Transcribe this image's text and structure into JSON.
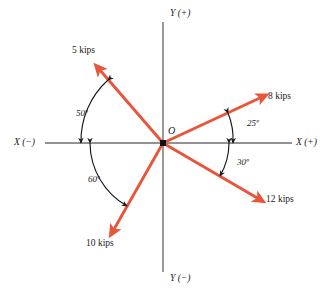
{
  "figure": {
    "type": "free-body-force-diagram",
    "units": "kips",
    "axis_color": "#6e6e6e",
    "vector_color": "#e8553a",
    "arc_color": "#1a1a1a",
    "text_color": "#1a1a1a",
    "background": "#ffffff"
  },
  "origin": {
    "label": "O",
    "x": 163,
    "y": 143
  },
  "axes": [
    {
      "name": "x-negative",
      "label": "X (−)",
      "label_x": 14,
      "label_y": 138
    },
    {
      "name": "x-positive",
      "label": "X (+)",
      "label_x": 296,
      "label_y": 138
    },
    {
      "name": "y-positive",
      "label": "Y (+)",
      "label_x": 170,
      "label_y": 9
    },
    {
      "name": "y-negative",
      "label": "Y (−)",
      "label_x": 170,
      "label_y": 274
    }
  ],
  "forces": [
    {
      "name": "force-5-kips",
      "label": "5 kips",
      "magnitude": 5,
      "angle_deg_from_positive_x": 130,
      "angle_from_axis_deg": 50,
      "reference_axis": "X (−)",
      "quadrant": "II",
      "label_x": 72,
      "label_y": 46
    },
    {
      "name": "force-8-kips",
      "label": "8 kips",
      "magnitude": 8,
      "angle_deg_from_positive_x": 25,
      "angle_from_axis_deg": 25,
      "reference_axis": "X (+)",
      "quadrant": "I",
      "label_x": 268,
      "label_y": 92
    },
    {
      "name": "force-12-kips",
      "label": "12 kips",
      "magnitude": 12,
      "angle_deg_from_positive_x": -30,
      "angle_from_axis_deg": 30,
      "reference_axis": "X (+)",
      "quadrant": "IV",
      "label_x": 266,
      "label_y": 195
    },
    {
      "name": "force-10-kips",
      "label": "10 kips",
      "magnitude": 10,
      "angle_deg_from_positive_x": 240,
      "angle_from_axis_deg": 60,
      "reference_axis": "X (−)",
      "quadrant": "III",
      "label_x": 86,
      "label_y": 239
    }
  ],
  "angles": [
    {
      "name": "angle-50",
      "label": "50º",
      "value": 50,
      "between": [
        "X (−)",
        "5 kips"
      ],
      "label_x": 76,
      "label_y": 109
    },
    {
      "name": "angle-60",
      "label": "60º",
      "value": 60,
      "between": [
        "X (−)",
        "10 kips"
      ],
      "label_x": 88,
      "label_y": 175
    },
    {
      "name": "angle-25",
      "label": "25º",
      "value": 25,
      "between": [
        "X (+)",
        "8 kips"
      ],
      "label_x": 247,
      "label_y": 119
    },
    {
      "name": "angle-30",
      "label": "30º",
      "value": 30,
      "between": [
        "X (+)",
        "12 kips"
      ],
      "label_x": 237,
      "label_y": 158
    }
  ]
}
